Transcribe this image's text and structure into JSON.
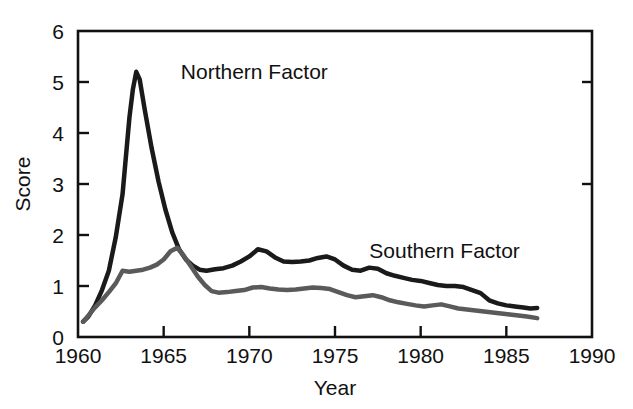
{
  "chart_data": {
    "type": "line",
    "title": "",
    "xlabel": "Year",
    "ylabel": "Score",
    "xlim": [
      1960,
      1990
    ],
    "ylim": [
      0,
      6
    ],
    "xticks": [
      1960,
      1965,
      1970,
      1975,
      1980,
      1985,
      1990
    ],
    "xtick_labels": [
      "1960",
      "1965",
      "1970",
      "1975",
      "1980",
      "1985",
      "1990"
    ],
    "yticks": [
      0,
      1,
      2,
      3,
      4,
      5,
      6
    ],
    "ytick_labels": [
      "0",
      "1",
      "2",
      "3",
      "4",
      "5",
      "6"
    ],
    "grid": false,
    "legend_position": "inline-annotation",
    "series": [
      {
        "name": "Northern Factor",
        "color": "#1a1a1a",
        "line_width": 4.5,
        "label_x": 1966.0,
        "label_y": 5.05,
        "x": [
          1960.3,
          1960.6,
          1961.0,
          1961.4,
          1961.8,
          1962.2,
          1962.6,
          1963.0,
          1963.2,
          1963.4,
          1963.6,
          1963.9,
          1964.3,
          1964.7,
          1965.1,
          1965.5,
          1965.9,
          1966.3,
          1966.7,
          1967.1,
          1967.5,
          1968.0,
          1968.5,
          1969.0,
          1969.5,
          1970.0,
          1970.5,
          1971.0,
          1971.5,
          1972.0,
          1972.5,
          1973.0,
          1973.5,
          1974.0,
          1974.5,
          1975.0,
          1975.5,
          1976.0,
          1976.5,
          1977.0,
          1977.5,
          1978.0,
          1978.5,
          1979.0,
          1979.5,
          1980.0,
          1980.5,
          1981.0,
          1981.5,
          1982.0,
          1982.5,
          1983.0,
          1983.5,
          1984.0,
          1984.5,
          1985.0,
          1985.5,
          1986.0,
          1986.4,
          1986.8
        ],
        "y": [
          0.3,
          0.4,
          0.62,
          0.92,
          1.3,
          1.95,
          2.8,
          4.3,
          4.85,
          5.2,
          5.05,
          4.45,
          3.7,
          3.05,
          2.5,
          2.05,
          1.72,
          1.52,
          1.4,
          1.32,
          1.3,
          1.33,
          1.35,
          1.4,
          1.48,
          1.58,
          1.72,
          1.68,
          1.56,
          1.48,
          1.47,
          1.48,
          1.5,
          1.55,
          1.58,
          1.52,
          1.4,
          1.32,
          1.3,
          1.36,
          1.34,
          1.25,
          1.2,
          1.16,
          1.12,
          1.1,
          1.06,
          1.02,
          1.0,
          1.0,
          0.98,
          0.92,
          0.86,
          0.72,
          0.66,
          0.62,
          0.6,
          0.58,
          0.56,
          0.57
        ]
      },
      {
        "name": "Southern Factor",
        "color": "#5a5a5a",
        "line_width": 4.5,
        "label_x": 1977.0,
        "label_y": 1.55,
        "x": [
          1960.3,
          1960.6,
          1961.0,
          1961.4,
          1961.8,
          1962.2,
          1962.6,
          1963.0,
          1963.4,
          1963.8,
          1964.2,
          1964.6,
          1965.0,
          1965.4,
          1965.8,
          1966.2,
          1966.6,
          1967.0,
          1967.4,
          1967.8,
          1968.2,
          1968.7,
          1969.2,
          1969.7,
          1970.2,
          1970.7,
          1971.2,
          1971.7,
          1972.2,
          1972.7,
          1973.2,
          1973.7,
          1974.2,
          1974.7,
          1975.2,
          1975.7,
          1976.2,
          1976.7,
          1977.2,
          1977.7,
          1978.2,
          1978.7,
          1979.2,
          1979.7,
          1980.2,
          1980.7,
          1981.2,
          1981.7,
          1982.2,
          1982.7,
          1983.2,
          1983.7,
          1984.2,
          1984.7,
          1985.2,
          1985.7,
          1986.2,
          1986.8
        ],
        "y": [
          0.3,
          0.42,
          0.58,
          0.72,
          0.88,
          1.05,
          1.3,
          1.28,
          1.3,
          1.32,
          1.36,
          1.42,
          1.52,
          1.68,
          1.75,
          1.58,
          1.38,
          1.18,
          1.02,
          0.9,
          0.87,
          0.88,
          0.9,
          0.92,
          0.97,
          0.98,
          0.95,
          0.93,
          0.92,
          0.93,
          0.95,
          0.97,
          0.96,
          0.94,
          0.88,
          0.82,
          0.78,
          0.8,
          0.82,
          0.78,
          0.72,
          0.68,
          0.65,
          0.62,
          0.6,
          0.62,
          0.64,
          0.6,
          0.56,
          0.54,
          0.52,
          0.5,
          0.48,
          0.46,
          0.44,
          0.42,
          0.4,
          0.37
        ]
      }
    ]
  },
  "figure": {
    "background": "#ffffff",
    "axis_color": "#111111"
  }
}
